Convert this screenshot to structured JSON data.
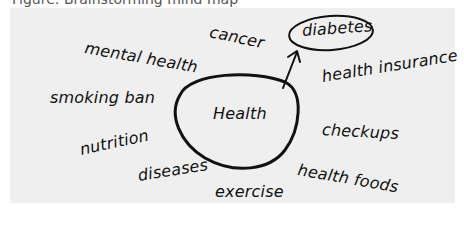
{
  "caption": {
    "text": "Figure: Brainstorming mind map"
  },
  "diagram": {
    "central_node": {
      "label": "Health"
    },
    "selected_node": {
      "label": "diabetes"
    },
    "nodes": [
      {
        "label": "mental health"
      },
      {
        "label": "cancer"
      },
      {
        "label": "diabetes"
      },
      {
        "label": "health insurance"
      },
      {
        "label": "smoking ban"
      },
      {
        "label": "checkups"
      },
      {
        "label": "nutrition"
      },
      {
        "label": "diseases"
      },
      {
        "label": "exercise"
      },
      {
        "label": "health foods"
      }
    ],
    "colors": {
      "panel": "#efefef",
      "ink": "#111111"
    }
  }
}
